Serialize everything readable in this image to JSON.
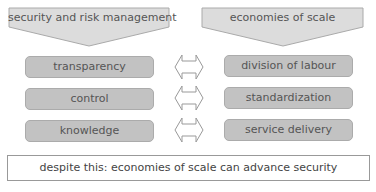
{
  "left_column": {
    "header": "security and risk management",
    "items": [
      "transparency",
      "control",
      "knowledge"
    ]
  },
  "right_column": {
    "header": "economies of scale",
    "items": [
      "division of labour",
      "standardization",
      "service delivery"
    ]
  },
  "connectors": [
    "double-arrow",
    "double-arrow",
    "double-arrow"
  ],
  "conclusion": "despite this: economies of scale can advance security",
  "colors": {
    "header_fill": "#dcdcdc",
    "pill_fill": "#c2c2c2",
    "text": "#555555"
  }
}
